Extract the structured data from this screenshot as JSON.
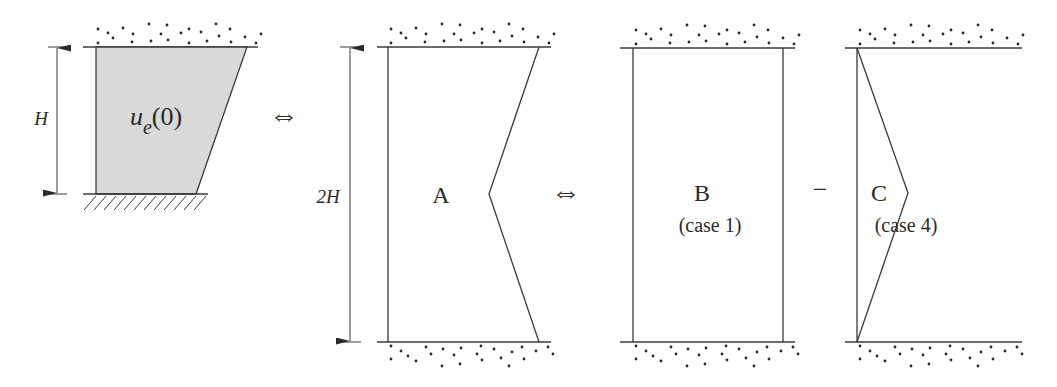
{
  "figure": {
    "panel_original": {
      "dimension_label": "H",
      "region_label_main": "u",
      "region_label_sub": "e",
      "region_label_arg": "(0)",
      "fill_color": "#d9d9d9",
      "boundary_top": "granular soil (dots)",
      "boundary_bottom": "fixed (hatched)"
    },
    "equivalence_symbol_1": "⇔",
    "panel_A": {
      "dimension_label": "2H",
      "label": "A"
    },
    "equivalence_symbol_2": "⇔",
    "panel_B": {
      "label": "B",
      "caption": "(case 1)"
    },
    "minus_symbol": "−",
    "panel_C": {
      "label": "C",
      "caption": "(case 4)"
    },
    "line_color": "#3a3a3a",
    "background": "#ffffff"
  }
}
